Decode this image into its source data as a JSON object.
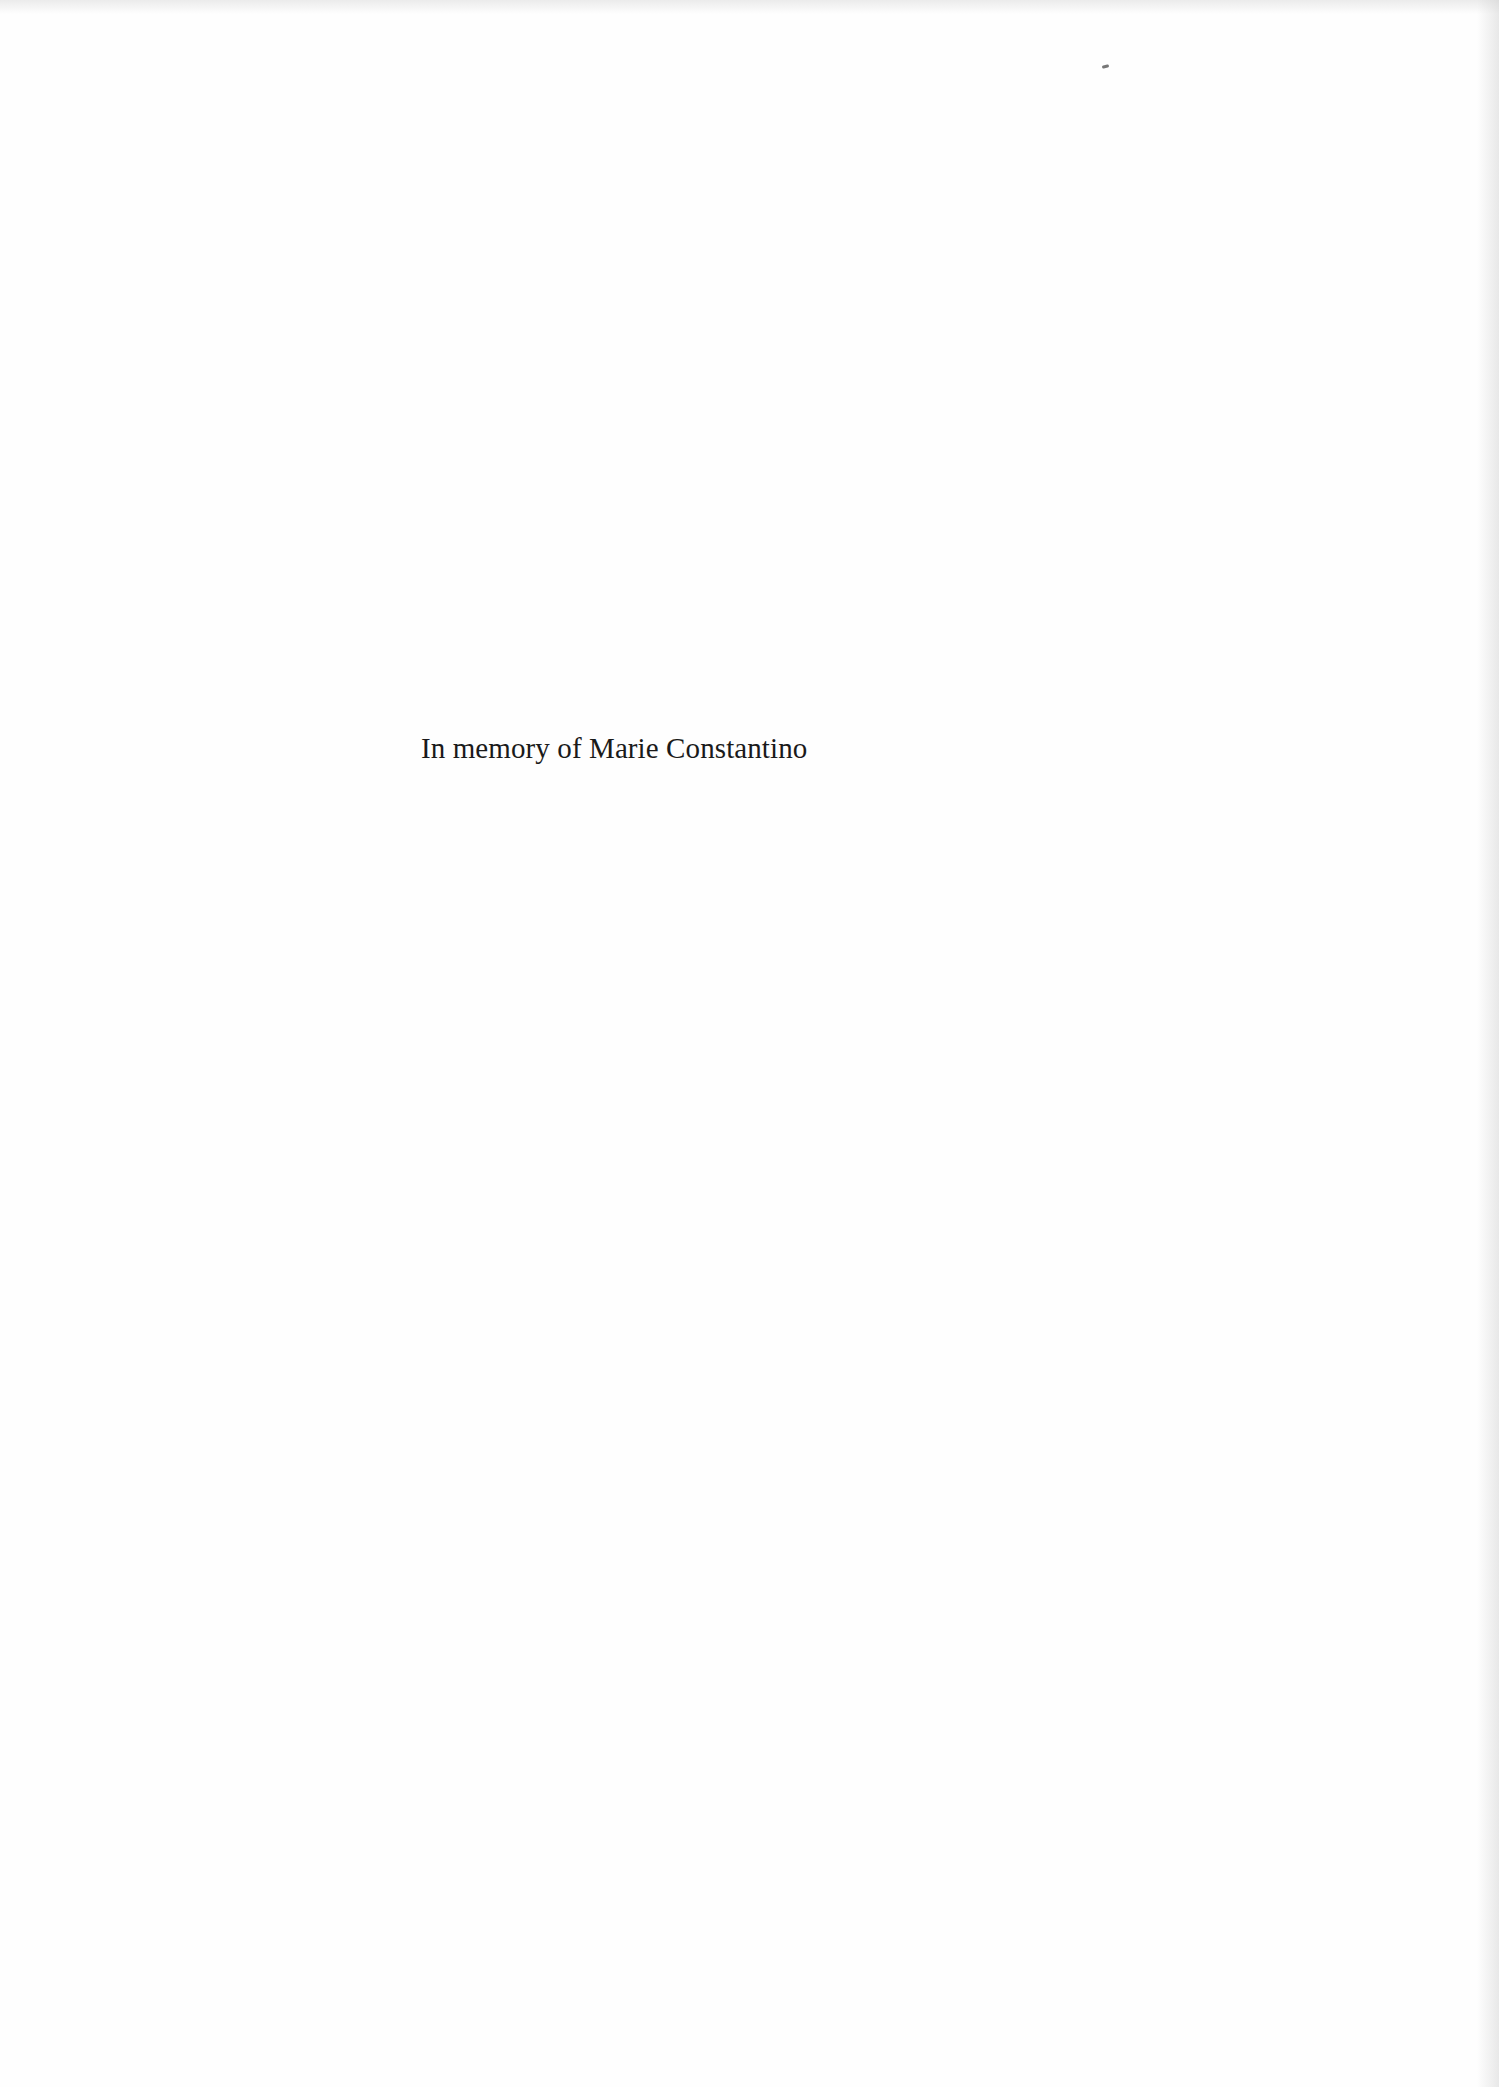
{
  "page": {
    "type": "dedication-page",
    "dedication_text": "In memory of Marie Constantino",
    "background_color": "#fefefe",
    "text_color": "#1a1a1a"
  }
}
